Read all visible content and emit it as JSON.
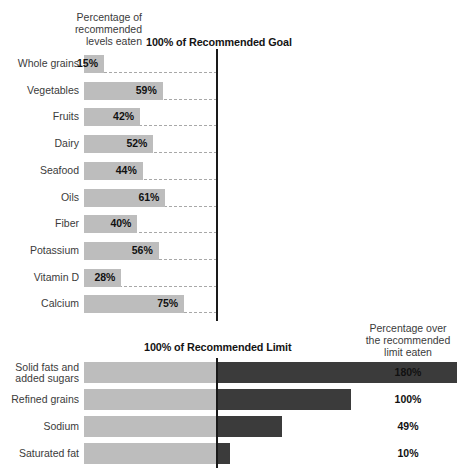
{
  "chart_data": [
    {
      "type": "bar",
      "title": "100% of Recommended Goal",
      "subtitle": "Percentage of\nrecommended\nlevels eaten",
      "orientation": "horizontal",
      "xlabel": "",
      "ylabel": "",
      "xlim": [
        0,
        100
      ],
      "reference_line": 100,
      "reference_line_label": "100% of Recommended Goal",
      "grid": "dashed-row-baselines",
      "units": "percent",
      "bar_color": "#bdbdbd",
      "categories": [
        "Whole grains",
        "Vegetables",
        "Fruits",
        "Dairy",
        "Seafood",
        "Oils",
        "Fiber",
        "Potassium",
        "Vitamin D",
        "Calcium"
      ],
      "values": [
        15,
        59,
        42,
        52,
        44,
        61,
        40,
        56,
        28,
        75
      ],
      "value_labels": [
        "15%",
        "59%",
        "42%",
        "52%",
        "44%",
        "61%",
        "40%",
        "56%",
        "28%",
        "75%"
      ]
    },
    {
      "type": "bar",
      "title": "100% of Recommended Limit",
      "subtitle": "Percentage over\nthe recommended\nlimit eaten",
      "orientation": "horizontal",
      "xlabel": "",
      "ylabel": "",
      "xlim": [
        0,
        280
      ],
      "reference_line": 100,
      "reference_line_label": "100% of Recommended Limit",
      "grid": "off",
      "units": "percent",
      "base_color": "#bdbdbd",
      "over_color": "#3b3b3b",
      "categories": [
        "Solid fats and\nadded sugars",
        "Refined grains",
        "Sodium",
        "Saturated fat"
      ],
      "values": [
        180,
        100,
        49,
        10
      ],
      "value_labels": [
        "180%",
        "100%",
        "49%",
        "10%"
      ]
    }
  ],
  "top_chart": {
    "header_left": "Percentage of\nrecommended\nlevels eaten",
    "header_center": "100% of Recommended Goal",
    "rows": [
      {
        "label": "Whole grains",
        "value_label": "15%"
      },
      {
        "label": "Vegetables",
        "value_label": "59%"
      },
      {
        "label": "Fruits",
        "value_label": "42%"
      },
      {
        "label": "Dairy",
        "value_label": "52%"
      },
      {
        "label": "Seafood",
        "value_label": "44%"
      },
      {
        "label": "Oils",
        "value_label": "61%"
      },
      {
        "label": "Fiber",
        "value_label": "40%"
      },
      {
        "label": "Potassium",
        "value_label": "56%"
      },
      {
        "label": "Vitamin D",
        "value_label": "28%"
      },
      {
        "label": "Calcium",
        "value_label": "75%"
      }
    ]
  },
  "bottom_chart": {
    "header_center": "100% of Recommended Limit",
    "header_right": "Percentage over\nthe recommended\nlimit eaten",
    "rows": [
      {
        "label": "Solid fats and\nadded sugars",
        "value_label": "180%"
      },
      {
        "label": "Refined grains",
        "value_label": "100%"
      },
      {
        "label": "Sodium",
        "value_label": "49%"
      },
      {
        "label": "Saturated fat",
        "value_label": "10%"
      }
    ]
  }
}
